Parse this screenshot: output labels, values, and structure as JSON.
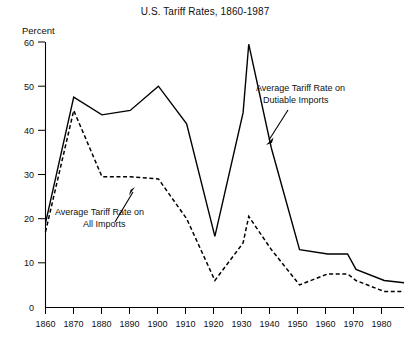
{
  "figure": {
    "title": "U.S. Tariff Rates, 1860-1987",
    "y_axis_label": "Percent"
  },
  "annotations": {
    "dutiable": {
      "line1": "Average Tariff Rate on",
      "line2": "Dutiable Imports"
    },
    "all": {
      "line1": "Average Tariff Rate on",
      "line2": "All Imports"
    }
  },
  "axis": {
    "y_ticks": [
      "0",
      "10",
      "20",
      "30",
      "40",
      "50",
      "60"
    ],
    "x_ticks": [
      "1860",
      "1870",
      "1880",
      "1890",
      "1900",
      "1910",
      "1920",
      "1930",
      "1940",
      "1950",
      "1960",
      "1970",
      "1980"
    ]
  },
  "chart_data": {
    "type": "line",
    "title": "U.S. Tariff Rates, 1860-1987",
    "xlabel": "",
    "ylabel": "Percent",
    "xlim": [
      1860,
      1987
    ],
    "ylim": [
      0,
      60
    ],
    "grid": false,
    "legend": "annotated-inline",
    "xticks": [
      1860,
      1870,
      1880,
      1890,
      1900,
      1910,
      1920,
      1930,
      1940,
      1950,
      1960,
      1970,
      1980
    ],
    "yticks": [
      0,
      10,
      20,
      30,
      40,
      50,
      60
    ],
    "series": [
      {
        "name": "Average Tariff Rate on Dutiable Imports",
        "style": "solid",
        "color": "#000000",
        "x": [
          1860,
          1870,
          1880,
          1890,
          1900,
          1910,
          1920,
          1930,
          1932,
          1940,
          1950,
          1960,
          1967,
          1970,
          1980,
          1987
        ],
        "values": [
          19,
          47.5,
          43.5,
          44.5,
          50,
          41.5,
          16,
          44,
          59.5,
          36,
          13,
          12,
          12,
          8.5,
          6,
          5.5
        ]
      },
      {
        "name": "Average Tariff Rate on All Imports",
        "style": "dashed",
        "color": "#000000",
        "x": [
          1860,
          1870,
          1880,
          1890,
          1900,
          1910,
          1920,
          1930,
          1932,
          1940,
          1950,
          1960,
          1967,
          1970,
          1980,
          1987
        ],
        "values": [
          17,
          44.5,
          29.5,
          29.5,
          29,
          20,
          6,
          14.5,
          20.5,
          13,
          5,
          7.5,
          7.5,
          6,
          3.5,
          3.5
        ]
      }
    ]
  }
}
